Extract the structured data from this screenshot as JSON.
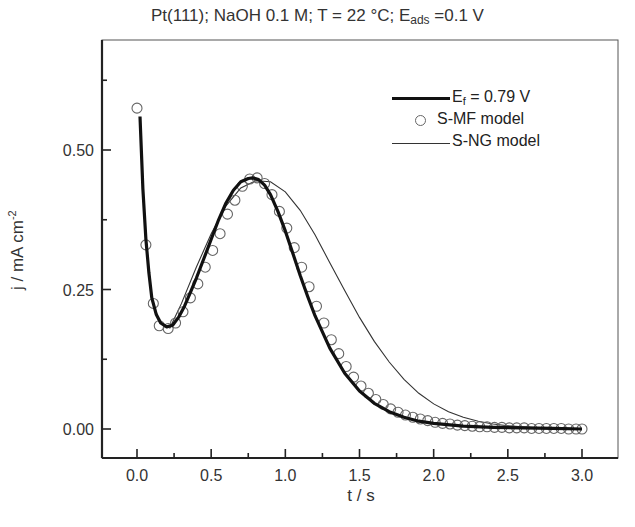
{
  "title": {
    "main": "Pt(111); NaOH 0.1 M; T = 22 °C; E",
    "sub": "ads",
    "tail": " =0.1 V"
  },
  "axes": {
    "xlabel": "t / s",
    "ylabel_main": "j / mA cm",
    "ylabel_sup": "-2",
    "xticks": [
      "0.0",
      "0.5",
      "1.0",
      "1.5",
      "2.0",
      "2.5",
      "3.0"
    ],
    "yticks": [
      "0.00",
      "0.25",
      "0.50"
    ]
  },
  "legend": {
    "items": [
      {
        "symbol": "thick-line",
        "label_main": "E",
        "label_sub": "f",
        "label_tail": " = 0.79 V"
      },
      {
        "symbol": "open-circle",
        "label": "S-MF model"
      },
      {
        "symbol": "thin-line",
        "label": "S-NG model"
      }
    ]
  },
  "colors": {
    "experiment": "#111111",
    "smf_markers": "#666666",
    "sng_line": "#333333",
    "axis": "#222222"
  },
  "chart_data": {
    "type": "line",
    "xlabel": "t / s",
    "ylabel": "j / mA cm^-2",
    "xlim": [
      -0.25,
      3.25
    ],
    "ylim": [
      -0.05,
      0.66
    ],
    "xticks": [
      0.0,
      0.5,
      1.0,
      1.5,
      2.0,
      2.5,
      3.0
    ],
    "yticks": [
      0.0,
      0.25,
      0.5
    ],
    "grid": false,
    "legend_position": "upper right",
    "series": [
      {
        "name": "E_f = 0.79 V",
        "style": "thick-line",
        "x": [
          0.02,
          0.04,
          0.06,
          0.08,
          0.1,
          0.13,
          0.16,
          0.2,
          0.24,
          0.28,
          0.32,
          0.36,
          0.4,
          0.45,
          0.5,
          0.55,
          0.6,
          0.65,
          0.7,
          0.75,
          0.78,
          0.82,
          0.86,
          0.9,
          0.95,
          1.0,
          1.05,
          1.1,
          1.15,
          1.2,
          1.3,
          1.4,
          1.5,
          1.6,
          1.7,
          1.8,
          1.9,
          2.0,
          2.2,
          2.4,
          2.6,
          2.8,
          3.0
        ],
        "y": [
          0.56,
          0.43,
          0.34,
          0.28,
          0.235,
          0.205,
          0.19,
          0.183,
          0.186,
          0.2,
          0.22,
          0.245,
          0.27,
          0.305,
          0.34,
          0.375,
          0.405,
          0.428,
          0.443,
          0.449,
          0.45,
          0.447,
          0.437,
          0.42,
          0.39,
          0.355,
          0.315,
          0.275,
          0.238,
          0.203,
          0.145,
          0.1,
          0.068,
          0.046,
          0.031,
          0.021,
          0.014,
          0.01,
          0.005,
          0.003,
          0.002,
          0.001,
          0.0
        ]
      },
      {
        "name": "S-MF model",
        "style": "open-circle",
        "x": [
          0.0,
          0.06,
          0.11,
          0.15,
          0.21,
          0.26,
          0.31,
          0.36,
          0.41,
          0.46,
          0.51,
          0.56,
          0.61,
          0.66,
          0.71,
          0.76,
          0.81,
          0.86,
          0.91,
          0.96,
          1.01,
          1.06,
          1.11,
          1.16,
          1.21,
          1.26,
          1.31,
          1.36,
          1.41,
          1.46,
          1.51,
          1.56,
          1.61,
          1.66,
          1.71,
          1.76,
          1.81,
          1.86,
          1.91,
          1.96,
          2.01,
          2.06,
          2.11,
          2.16,
          2.21,
          2.26,
          2.31,
          2.36,
          2.41,
          2.46,
          2.51,
          2.56,
          2.61,
          2.66,
          2.71,
          2.76,
          2.81,
          2.86,
          2.91,
          2.96,
          3.0
        ],
        "y": [
          0.575,
          0.33,
          0.225,
          0.185,
          0.18,
          0.19,
          0.21,
          0.235,
          0.26,
          0.29,
          0.32,
          0.35,
          0.385,
          0.41,
          0.435,
          0.448,
          0.45,
          0.44,
          0.42,
          0.39,
          0.36,
          0.325,
          0.29,
          0.255,
          0.22,
          0.19,
          0.16,
          0.135,
          0.112,
          0.093,
          0.077,
          0.064,
          0.053,
          0.044,
          0.036,
          0.03,
          0.025,
          0.021,
          0.018,
          0.015,
          0.012,
          0.01,
          0.009,
          0.007,
          0.006,
          0.005,
          0.004,
          0.004,
          0.003,
          0.003,
          0.002,
          0.002,
          0.002,
          0.001,
          0.001,
          0.001,
          0.001,
          0.001,
          0.0,
          0.0,
          0.0
        ]
      },
      {
        "name": "S-NG model",
        "style": "thin-line",
        "x": [
          0.22,
          0.3,
          0.4,
          0.5,
          0.6,
          0.7,
          0.8,
          0.9,
          1.0,
          1.1,
          1.2,
          1.3,
          1.4,
          1.5,
          1.6,
          1.7,
          1.8,
          1.9,
          2.0,
          2.1,
          2.2,
          2.3,
          2.4,
          2.5,
          2.6,
          2.7,
          2.8,
          2.9,
          3.0
        ],
        "y": [
          0.18,
          0.225,
          0.29,
          0.35,
          0.4,
          0.432,
          0.445,
          0.443,
          0.425,
          0.392,
          0.348,
          0.298,
          0.248,
          0.2,
          0.157,
          0.12,
          0.089,
          0.064,
          0.045,
          0.031,
          0.021,
          0.014,
          0.009,
          0.006,
          0.004,
          0.002,
          0.0015,
          0.001,
          0.0
        ]
      }
    ]
  }
}
